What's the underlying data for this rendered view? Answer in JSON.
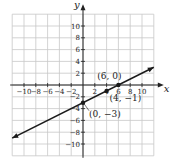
{
  "chart_data": {
    "type": "line",
    "title": "",
    "xlabel": "x",
    "ylabel": "y",
    "xlim": [
      -12,
      12
    ],
    "ylim": [
      -12,
      12
    ],
    "grid": true,
    "grid_step": 2,
    "x_ticks": [
      -10,
      -8,
      -6,
      -4,
      -2,
      2,
      4,
      6,
      8,
      10
    ],
    "y_ticks": [
      10,
      8,
      6,
      4,
      2,
      -2,
      -4,
      -6,
      -8,
      -10
    ],
    "x_tick_labels": [
      "−10",
      "−8",
      "−6",
      "−4",
      "−2",
      "2",
      "4",
      "6",
      "8",
      "10"
    ],
    "y_tick_labels": [
      "10",
      "8",
      "6",
      "4",
      "2",
      "−2",
      "−4",
      "−6",
      "−8",
      "−10"
    ],
    "series": [
      {
        "name": "line",
        "equation": "y = x/2 - 3",
        "x": [
          -12,
          12
        ],
        "y": [
          -9,
          3
        ]
      }
    ],
    "points": [
      {
        "x": 6,
        "y": 0,
        "label": "(6, 0)"
      },
      {
        "x": 4,
        "y": -1,
        "label": "(4, −1)"
      },
      {
        "x": 0,
        "y": -3,
        "label": "(0, −3)"
      }
    ]
  },
  "colors": {
    "grid": "#c8c8c8",
    "axis": "#222222",
    "line": "#1a1a1a"
  }
}
